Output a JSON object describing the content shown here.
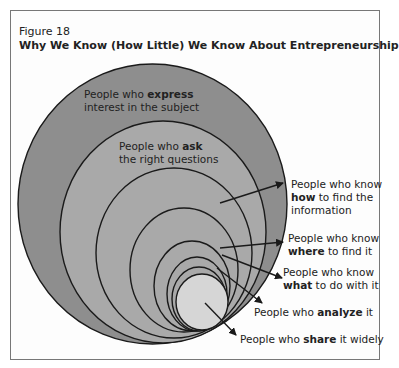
{
  "figure": {
    "label": "Figure 18",
    "title": "Why We Know (How Little) We Know About Entrepreneurship"
  },
  "colors": {
    "outer_ring": "#8e8e8e",
    "inner_rings": "#a9a9a9",
    "innermost": "#d6d6d6",
    "stroke": "#1a1a1a"
  },
  "rings": [
    {
      "level": 1,
      "pre": "People who ",
      "bold": "express",
      "post": "",
      "line2": "interest in the subject"
    },
    {
      "level": 2,
      "pre": "People who ",
      "bold": "ask",
      "post": "",
      "line2": "the right questions"
    },
    {
      "level": 3,
      "line1": "People who know",
      "bold": "how",
      "post": " to find the",
      "line3": "information"
    },
    {
      "level": 4,
      "line1": "People who know",
      "bold": "where",
      "post": " to find it"
    },
    {
      "level": 5,
      "line1": "People who know",
      "bold": "what",
      "post": " to do with it"
    },
    {
      "level": 6,
      "pre": "People who ",
      "bold": "analyze",
      "post": " it"
    },
    {
      "level": 7,
      "pre": "People who ",
      "bold": "share",
      "post": " it widely"
    }
  ]
}
